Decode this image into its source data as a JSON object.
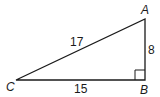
{
  "diagram": {
    "type": "right-triangle",
    "vertices": {
      "A": {
        "label": "A",
        "x": 145,
        "y": 19
      },
      "B": {
        "label": "B",
        "x": 145,
        "y": 80
      },
      "C": {
        "label": "C",
        "x": 16,
        "y": 80
      }
    },
    "sides": {
      "AC": {
        "label": "17"
      },
      "AB": {
        "label": "8"
      },
      "CB": {
        "label": "15"
      }
    },
    "right_angle_at": "B",
    "stroke_color": "#1a1a1a"
  }
}
